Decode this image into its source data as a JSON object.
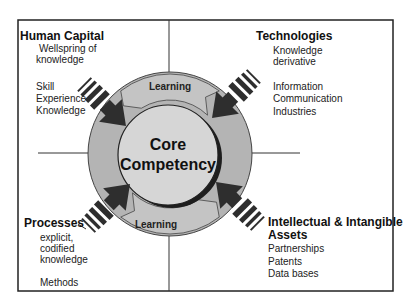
{
  "center": {
    "line1": "Core",
    "line2": "Competency"
  },
  "ring": {
    "top_label": "Learning",
    "bottom_label": "Learning"
  },
  "quadrants": {
    "top_left": {
      "title": "Human Capital",
      "lines_a": [
        "Wellspring of",
        "knowledge"
      ],
      "lines_b": [
        "Skill",
        "Experience",
        "Knowledge"
      ]
    },
    "top_right": {
      "title": "Technologies",
      "lines_a": [
        "Knowledge",
        "derivative"
      ],
      "lines_b": [
        "Information",
        "Communication",
        "Industries"
      ]
    },
    "bottom_left": {
      "title": "Processes",
      "lines_a": [
        "explicit,",
        "codified",
        "knowledge"
      ],
      "lines_b": [
        "Methods"
      ]
    },
    "bottom_right": {
      "title_line1": "Intellectual & Intangible",
      "title_line2": "Assets",
      "lines_a": [
        "Partnerships",
        "Patents",
        "Data bases"
      ]
    }
  },
  "colors": {
    "ring_fill": "#b4b4b4",
    "segment_fill": "#c4c4c4",
    "inner_fill": "#d6d6d6",
    "arrow_fill": "#2e2e2e",
    "line": "#333333"
  }
}
